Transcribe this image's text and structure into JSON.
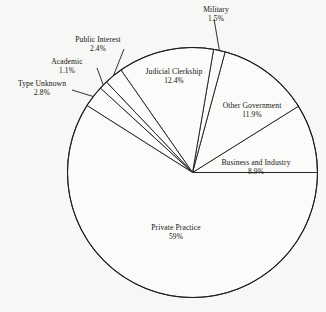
{
  "chart_data": {
    "type": "pie",
    "title": "",
    "subtitle": "",
    "xlabel": "",
    "ylabel": "",
    "legend_position": "none",
    "grid": false,
    "units": "percent",
    "start_angle_deg": 0,
    "direction": "counterclockwise",
    "categories": [
      "Business and Industry",
      "Other Government",
      "Military",
      "Judicial Clerkship",
      "Public Interest",
      "Academic",
      "Type Unknown",
      "Private Practice"
    ],
    "values": [
      8.9,
      11.9,
      1.5,
      12.4,
      2.4,
      1.1,
      2.8,
      59
    ],
    "slices": [
      {
        "label": "Business and Industry",
        "value": 8.9,
        "value_text": "8.9%",
        "label_placement": "inside-right",
        "label_x": 256,
        "label_y": 163,
        "has_leader": false
      },
      {
        "label": "Other Government",
        "value": 11.9,
        "value_text": "11.9%",
        "label_placement": "inside-upper-right",
        "label_x": 252,
        "label_y": 106,
        "has_leader": false
      },
      {
        "label": "Military",
        "value": 1.5,
        "value_text": "1.5%",
        "label_placement": "outside-top",
        "label_x": 216,
        "label_y": 10,
        "has_leader": true
      },
      {
        "label": "Judicial Clerkship",
        "value": 12.4,
        "value_text": "12.4%",
        "label_placement": "inside-upper-left",
        "label_x": 174,
        "label_y": 72,
        "has_leader": false
      },
      {
        "label": "Public Interest",
        "value": 2.4,
        "value_text": "2.4%",
        "label_placement": "outside-upper-left",
        "label_x": 98,
        "label_y": 40,
        "has_leader": true
      },
      {
        "label": "Academic",
        "value": 1.1,
        "value_text": "1.1%",
        "label_placement": "outside-left",
        "label_x": 67,
        "label_y": 62,
        "has_leader": true
      },
      {
        "label": "Type Unknown",
        "value": 2.8,
        "value_text": "2.8%",
        "label_placement": "outside-left",
        "label_x": 42,
        "label_y": 84,
        "has_leader": true
      },
      {
        "label": "Private Practice",
        "value": 59,
        "value_text": "59%",
        "label_placement": "inside-bottom",
        "label_x": 176,
        "label_y": 228,
        "has_leader": false
      }
    ],
    "geometry": {
      "center_x": 192.5,
      "center_y": 172.5,
      "radius": 125
    },
    "colors": {
      "stroke": "#1c1c1c",
      "fill": "#fbfbf9",
      "background": "#f7f7f5",
      "text": "#141414"
    }
  }
}
